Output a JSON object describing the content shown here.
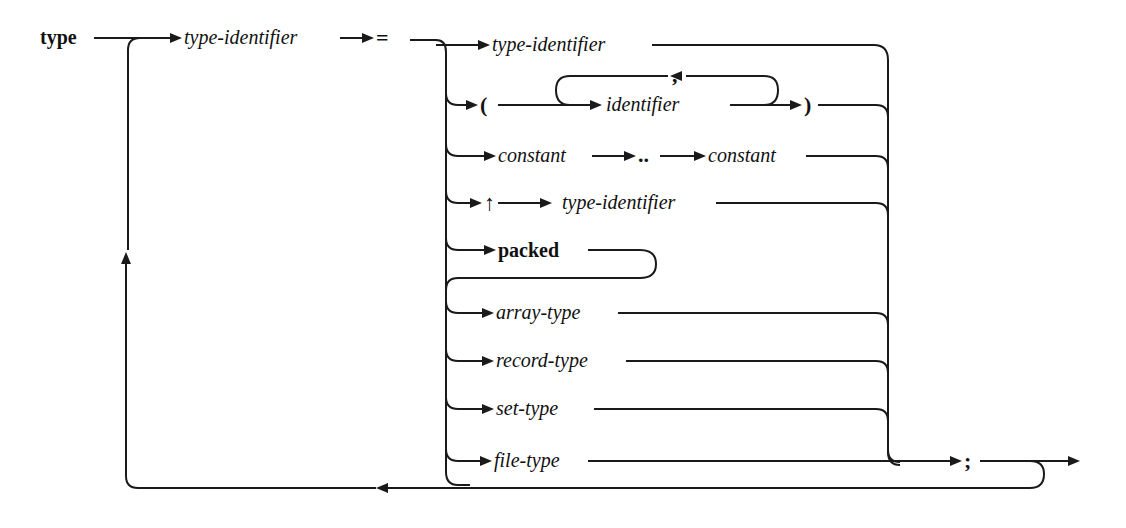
{
  "diagram": {
    "kind": "syntax-diagram",
    "keyword": "type",
    "head": {
      "name": "type-identifier",
      "equals": "="
    },
    "alternatives": [
      {
        "label": "type-identifier"
      },
      {
        "open": "(",
        "item": "identifier",
        "separator": ",",
        "close": ")"
      },
      {
        "from": "constant",
        "range": "..",
        "to": "constant"
      },
      {
        "pointer": "↑",
        "target": "type-identifier"
      },
      {
        "prefix": "packed"
      },
      {
        "label": "array-type"
      },
      {
        "label": "record-type"
      },
      {
        "label": "set-type"
      },
      {
        "label": "file-type"
      }
    ],
    "terminator": ";"
  }
}
